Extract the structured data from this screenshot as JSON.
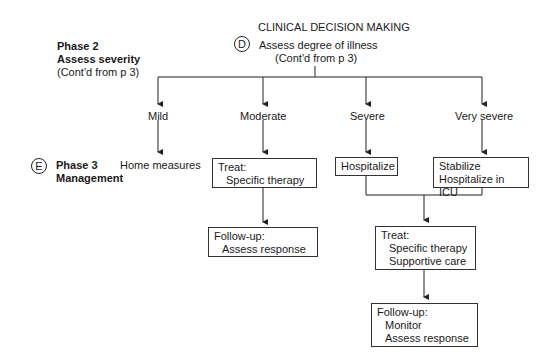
{
  "title": "CLINICAL DECISION MAKING",
  "phase2": {
    "heading": "Phase 2",
    "subheading": "Assess severity",
    "note": "(Cont'd from p 3)"
  },
  "phase3": {
    "marker": "E",
    "heading": "Phase 3",
    "subheading": "Management"
  },
  "root": {
    "marker": "D",
    "label": "Assess degree of illness",
    "note": "(Cont'd from p 3)"
  },
  "severity": [
    "Mild",
    "Moderate",
    "Severe",
    "Very severe"
  ],
  "mild_action": "Home measures",
  "moderate": {
    "treat_title": "Treat:",
    "treat_items": [
      "Specific therapy"
    ],
    "followup_title": "Follow-up:",
    "followup_items": [
      "Assess response"
    ]
  },
  "severe_action": "Hospitalize",
  "very_severe_action": [
    "Stabilize",
    "Hospitalize in ICU"
  ],
  "combined": {
    "treat_title": "Treat:",
    "treat_items": [
      "Specific therapy",
      "Supportive care"
    ],
    "followup_title": "Follow-up:",
    "followup_items": [
      "Monitor",
      "Assess response"
    ]
  }
}
